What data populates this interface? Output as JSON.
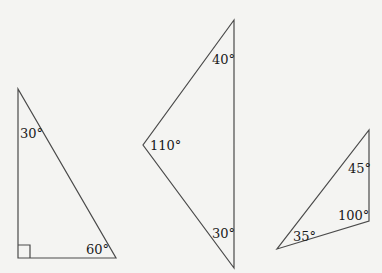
{
  "figure": {
    "triangles": [
      {
        "id": "right-triangle",
        "vertices": [
          [
            18,
            89
          ],
          [
            18,
            258
          ],
          [
            116,
            258
          ]
        ],
        "right_angle_marker": true,
        "angles": [
          {
            "label": "30°",
            "value": 30,
            "vertex": "top"
          },
          {
            "label": "60°",
            "value": 60,
            "vertex": "bottom-right"
          },
          {
            "label": "90°",
            "value": 90,
            "vertex": "bottom-left",
            "shown_as": "square-marker"
          }
        ]
      },
      {
        "id": "obtuse-triangle",
        "vertices": [
          [
            234,
            20
          ],
          [
            143,
            145
          ],
          [
            234,
            268
          ]
        ],
        "angles": [
          {
            "label": "40°",
            "value": 40,
            "vertex": "top"
          },
          {
            "label": "110°",
            "value": 110,
            "vertex": "left"
          },
          {
            "label": "30°",
            "value": 30,
            "vertex": "bottom"
          }
        ]
      },
      {
        "id": "small-obtuse-triangle",
        "vertices": [
          [
            369,
            130
          ],
          [
            369,
            221
          ],
          [
            277,
            249
          ]
        ],
        "angles": [
          {
            "label": "45°",
            "value": 45,
            "vertex": "top"
          },
          {
            "label": "100°",
            "value": 100,
            "vertex": "right"
          },
          {
            "label": "35°",
            "value": 35,
            "vertex": "bottom-left"
          }
        ]
      }
    ]
  },
  "labels": {
    "t1_top": "30°",
    "t1_bottom_right": "60°",
    "t2_top": "40°",
    "t2_left": "110°",
    "t2_bottom": "30°",
    "t3_top": "45°",
    "t3_right": "100°",
    "t3_bottom_left": "35°"
  },
  "colors": {
    "background": "#f4f4f2",
    "line": "#4a4a4a",
    "text": "#1a1a1a"
  }
}
